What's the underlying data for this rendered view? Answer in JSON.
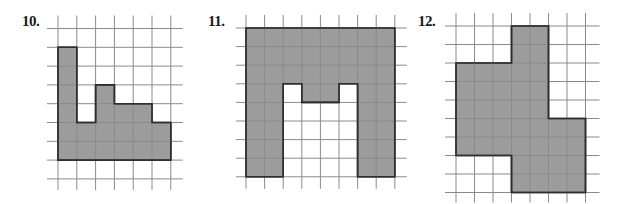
{
  "figures": [
    {
      "label": "10.",
      "label_pos": [
        22,
        14
      ],
      "grid": {
        "origin": [
          58,
          28.5
        ],
        "cell": 18.8,
        "cols": 6,
        "rows": 8,
        "extend": {
          "left": 11,
          "right": 12,
          "top": 13,
          "bottom": 11
        }
      },
      "shape_cells": [
        [
          0,
          1
        ],
        [
          1,
          1
        ],
        [
          1,
          5
        ],
        [
          2,
          5
        ],
        [
          2,
          3
        ],
        [
          3,
          3
        ],
        [
          3,
          4
        ],
        [
          5,
          4
        ],
        [
          5,
          5
        ],
        [
          6,
          5
        ],
        [
          6,
          7
        ],
        [
          0,
          7
        ]
      ],
      "shaded_area_units": 20
    },
    {
      "label": "11.",
      "label_pos": [
        208,
        14
      ],
      "grid": {
        "origin": [
          246,
          28
        ],
        "cell": 18.6,
        "cols": 8,
        "rows": 8,
        "extend": {
          "left": 10,
          "right": 12,
          "top": 13,
          "bottom": 12
        }
      },
      "shape_cells": [
        [
          0,
          0
        ],
        [
          8,
          0
        ],
        [
          8,
          8
        ],
        [
          6,
          8
        ],
        [
          6,
          3
        ],
        [
          5,
          3
        ],
        [
          5,
          4
        ],
        [
          3,
          4
        ],
        [
          3,
          3
        ],
        [
          2,
          3
        ],
        [
          2,
          8
        ],
        [
          0,
          8
        ]
      ],
      "shaded_area_units": 42
    },
    {
      "label": "12.",
      "label_pos": [
        418,
        14
      ],
      "grid": {
        "origin": [
          456,
          26
        ],
        "cell": 18.5,
        "cols": 7,
        "rows": 9,
        "extend": {
          "left": 11,
          "right": 14,
          "top": 13,
          "bottom": 10
        }
      },
      "shape_cells": [
        [
          3,
          0
        ],
        [
          5,
          0
        ],
        [
          5,
          5
        ],
        [
          7,
          5
        ],
        [
          7,
          9
        ],
        [
          3,
          9
        ],
        [
          3,
          7
        ],
        [
          0,
          7
        ],
        [
          0,
          2
        ],
        [
          3,
          2
        ]
      ],
      "shaded_area_units": 39
    }
  ],
  "colors": {
    "background": "#ffffff",
    "grid_line": "#8a8a8a",
    "shape_fill": "#9c9c9c",
    "shape_outline": "#2e2e2e",
    "label": "#1a1a1a"
  }
}
